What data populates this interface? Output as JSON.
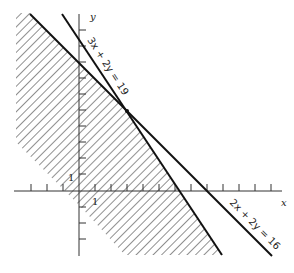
{
  "diagram": {
    "type": "linear-inequalities-feasible-region",
    "axes": {
      "x_label": "x",
      "y_label": "y",
      "tick_unit_label_x": "1",
      "tick_unit_label_y": "1"
    },
    "lines": [
      {
        "label": "3x + 2y = 19",
        "points": [
          [
            0,
            9.5
          ],
          [
            6.33,
            0
          ]
        ]
      },
      {
        "label": "2x + 2y = 16",
        "points": [
          [
            0,
            8
          ],
          [
            8,
            0
          ]
        ]
      }
    ],
    "intersection": [
      3,
      5
    ],
    "shaded_region": "below both lines (hatched)"
  }
}
